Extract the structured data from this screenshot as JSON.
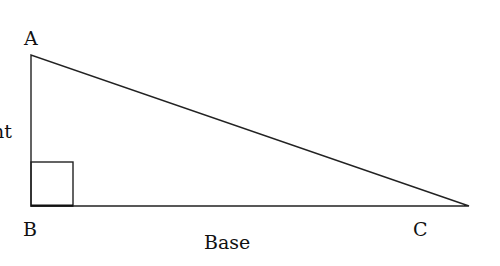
{
  "diagram": {
    "type": "right-triangle",
    "vertices": {
      "A": {
        "label": "A",
        "x": 31,
        "y": 55
      },
      "B": {
        "label": "B",
        "x": 31,
        "y": 206
      },
      "C": {
        "label": "C",
        "x": 469,
        "y": 206
      }
    },
    "right_angle_at": "B",
    "side_labels": {
      "height": "Height",
      "base": "Base"
    },
    "colors": {
      "stroke": "#222222",
      "text": "#111111",
      "background": "#ffffff"
    }
  }
}
